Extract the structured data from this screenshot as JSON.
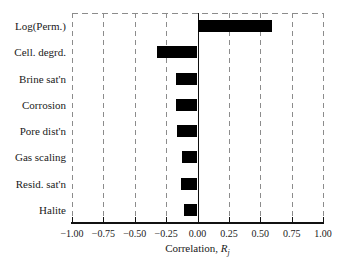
{
  "chart_data": {
    "type": "bar",
    "orientation": "horizontal",
    "title": "",
    "categories": [
      "Log(Perm.)",
      "Cell. degrd.",
      "Brine sat'n",
      "Corrosion",
      "Pore dist'n",
      "Gas scaling",
      "Resid. sat'n",
      "Halite"
    ],
    "values": [
      0.59,
      -0.32,
      -0.17,
      -0.17,
      -0.16,
      -0.12,
      -0.13,
      -0.11
    ],
    "xlabel": "Correlation, R_j",
    "xlabel_prefix": "Correlation, ",
    "xlabel_symbol": "R",
    "xlabel_subscript": "j",
    "xlim": [
      -1.0,
      1.0
    ],
    "xticks": [
      -1.0,
      -0.75,
      -0.5,
      -0.25,
      0.0,
      0.25,
      0.5,
      0.75,
      1.0
    ],
    "xtick_labels": [
      "−1.00",
      "−0.75",
      "−0.50",
      "−0.25",
      "0.00",
      "0.25",
      "0.50",
      "0.75",
      "1.00"
    ],
    "grid": true,
    "gridline_style": "dashed",
    "legend": false,
    "bar_color": "#000000",
    "gridline_color": "#8c8c8c",
    "axis_color": "#111111",
    "text_color": "#1a1a1a",
    "background_color": "#ffffff"
  }
}
